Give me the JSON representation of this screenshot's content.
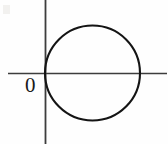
{
  "figure": {
    "canvas": {
      "width": 168,
      "height": 144,
      "background": "#fefefe"
    },
    "labels": {
      "origin": "0"
    },
    "colors": {
      "axis": "#3d3d3d",
      "curve": "#141414",
      "label": "#1a1a1a"
    },
    "axes": {
      "x_axis": {
        "y": 73,
        "x_start": 8,
        "x_end": 167,
        "stroke_width": 1.6
      },
      "y_axis": {
        "x": 45,
        "y_start": 0,
        "y_end": 144,
        "stroke_width": 1.8
      }
    }
  },
  "chart_data": {
    "type": "line",
    "title": "",
    "subtitle": "",
    "xlabel": "",
    "ylabel": "",
    "grid": false,
    "legend": null,
    "annotations": [
      {
        "text": "0",
        "x": 0,
        "y": 0,
        "position": "below-left-of-origin"
      }
    ],
    "series": [
      {
        "name": "circle",
        "shape": "circle",
        "center": {
          "x": 92.5,
          "y": 73
        },
        "radius": 47.5,
        "tangent_point": {
          "x": 45,
          "y": 73
        },
        "stroke": "#141414",
        "stroke_width": 2.1,
        "fill": "none"
      }
    ],
    "axis_ticks": {
      "x": [],
      "y": []
    },
    "xlim": [
      8,
      167
    ],
    "ylim": [
      0,
      144
    ]
  }
}
